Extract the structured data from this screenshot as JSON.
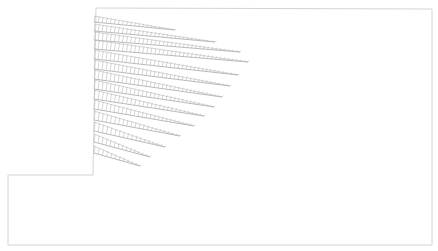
{
  "diagram": {
    "type": "load-distribution-field",
    "colors": {
      "background": "#ffffff",
      "outline": "#d4d4d4",
      "hatch": "#b8b8b8",
      "baseline": "#a8a8a8"
    },
    "outline_points": [
      [
        96,
        8
      ],
      [
        432,
        9
      ],
      [
        432,
        245
      ],
      [
        8,
        245
      ],
      [
        8,
        175
      ],
      [
        93,
        175
      ],
      [
        96,
        8
      ]
    ],
    "rows": [
      {
        "x0": 94,
        "y0": 22,
        "x1": 175,
        "y1": 30,
        "h": 6
      },
      {
        "x0": 94,
        "y0": 31,
        "x1": 215,
        "y1": 42,
        "h": 7
      },
      {
        "x0": 94,
        "y0": 40,
        "x1": 240,
        "y1": 52,
        "h": 8
      },
      {
        "x0": 94,
        "y0": 49,
        "x1": 248,
        "y1": 62,
        "h": 9
      },
      {
        "x0": 94,
        "y0": 59,
        "x1": 238,
        "y1": 75,
        "h": 9
      },
      {
        "x0": 94,
        "y0": 69,
        "x1": 230,
        "y1": 86,
        "h": 9
      },
      {
        "x0": 94,
        "y0": 79,
        "x1": 222,
        "y1": 97,
        "h": 9
      },
      {
        "x0": 94,
        "y0": 89,
        "x1": 214,
        "y1": 107,
        "h": 9
      },
      {
        "x0": 94,
        "y0": 99,
        "x1": 204,
        "y1": 116,
        "h": 9
      },
      {
        "x0": 94,
        "y0": 109,
        "x1": 194,
        "y1": 126,
        "h": 9
      },
      {
        "x0": 94,
        "y0": 120,
        "x1": 180,
        "y1": 136,
        "h": 9
      },
      {
        "x0": 94,
        "y0": 131,
        "x1": 165,
        "y1": 147,
        "h": 9
      },
      {
        "x0": 94,
        "y0": 142,
        "x1": 150,
        "y1": 157,
        "h": 8
      },
      {
        "x0": 94,
        "y0": 153,
        "x1": 140,
        "y1": 166,
        "h": 7
      }
    ],
    "hatch_spacing": 4
  }
}
